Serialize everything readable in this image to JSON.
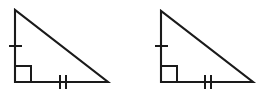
{
  "figure": {
    "background_color": "#ffffff",
    "stroke_color": "#1a1a1a",
    "stroke_width": 2,
    "canvas": {
      "width": 266,
      "height": 97
    },
    "shapes": [
      {
        "name": "left-triangle",
        "label": "Left right triangle",
        "type": "right-triangle",
        "vertices": {
          "apex": {
            "x": 15,
            "y": 10
          },
          "right_angle": {
            "x": 15,
            "y": 82
          },
          "base_end": {
            "x": 108,
            "y": 82
          }
        },
        "path": "M 15 10 L 15 82 L 108 82 Z",
        "right_angle_marker": {
          "name": "right-angle-square",
          "path": "M 15 66 L 31 66 L 31 82",
          "size": 16,
          "position": "bottom-left vertex"
        },
        "tick_marks": [
          {
            "name": "vertical-leg-single-tick",
            "side": "vertical-leg",
            "count": 1,
            "orientation": "horizontal",
            "marks": [
              {
                "x1": 9,
                "y1": 46,
                "x2": 22,
                "y2": 46
              }
            ]
          },
          {
            "name": "horizontal-leg-double-tick",
            "side": "horizontal-leg",
            "count": 2,
            "orientation": "vertical",
            "marks": [
              {
                "x1": 60,
                "y1": 75,
                "x2": 60,
                "y2": 89
              },
              {
                "x1": 66,
                "y1": 75,
                "x2": 66,
                "y2": 89
              }
            ]
          }
        ]
      },
      {
        "name": "right-triangle",
        "label": "Right right triangle",
        "type": "right-triangle",
        "vertices": {
          "apex": {
            "x": 161,
            "y": 11
          },
          "right_angle": {
            "x": 161,
            "y": 82
          },
          "base_end": {
            "x": 253,
            "y": 82
          }
        },
        "path": "M 161 11 L 161 82 L 253 82 Z",
        "right_angle_marker": {
          "name": "right-angle-square",
          "path": "M 161 66 L 177 66 L 177 82",
          "size": 16,
          "position": "bottom-left vertex"
        },
        "tick_marks": [
          {
            "name": "vertical-leg-single-tick",
            "side": "vertical-leg",
            "count": 1,
            "orientation": "horizontal",
            "marks": [
              {
                "x1": 155,
                "y1": 46,
                "x2": 168,
                "y2": 46
              }
            ]
          },
          {
            "name": "horizontal-leg-double-tick",
            "side": "horizontal-leg",
            "count": 2,
            "orientation": "vertical",
            "marks": [
              {
                "x1": 205,
                "y1": 75,
                "x2": 205,
                "y2": 89
              },
              {
                "x1": 211,
                "y1": 75,
                "x2": 211,
                "y2": 89
              }
            ]
          }
        ]
      }
    ]
  }
}
